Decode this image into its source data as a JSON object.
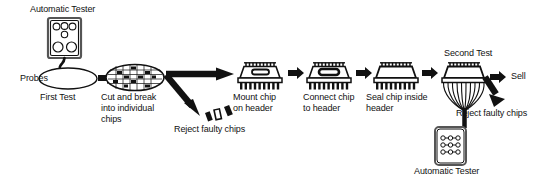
{
  "diagram": {
    "ink_color": "#111111",
    "background_color": "#ffffff"
  },
  "labels": {
    "automatic_tester_top": "Automatic Tester",
    "probes": "Probes",
    "first_test": "First Test",
    "cut_and_break": "Cut and break\ninto individual\nchips",
    "reject_faulty_chips_1": "Reject faulty chips",
    "mount_chip": "Mount chip\non header",
    "connect_chip": "Connect chip\nto header",
    "seal_chip": "Seal chip inside\nheader",
    "second_test": "Second Test",
    "sell": "Sell",
    "reject_faulty_chips_2": "Reject faulty chips",
    "automatic_tester_bottom": "Automatic Tester"
  },
  "stages": [
    {
      "id": "first-test",
      "label": "First Test",
      "shape": "wafer-ellipse"
    },
    {
      "id": "cut-and-break",
      "label": "Cut and break into individual chips",
      "shape": "wafer-with-dies"
    },
    {
      "id": "mount-chip",
      "label": "Mount chip on header",
      "shape": "header-with-chip"
    },
    {
      "id": "connect-chip",
      "label": "Connect chip to header",
      "shape": "header-with-bonded-chip"
    },
    {
      "id": "seal-chip",
      "label": "Seal chip inside header",
      "shape": "sealed-header"
    },
    {
      "id": "second-test",
      "label": "Second Test",
      "shape": "header-with-probe-wires"
    }
  ],
  "outcomes": [
    {
      "id": "reject-1",
      "label": "Reject faulty chips"
    },
    {
      "id": "sell",
      "label": "Sell"
    },
    {
      "id": "reject-2",
      "label": "Reject faulty chips"
    }
  ],
  "equipment": [
    {
      "id": "tester-top",
      "label": "Automatic Tester",
      "indicators": 6
    },
    {
      "id": "tester-bottom",
      "label": "Automatic Tester",
      "indicators": 9
    }
  ]
}
